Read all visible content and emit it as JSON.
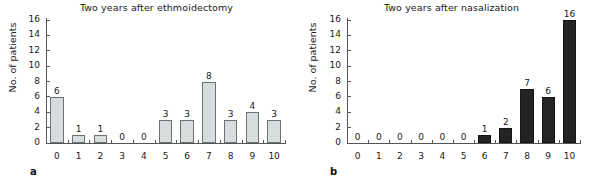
{
  "figure": {
    "panels": [
      {
        "letter": "a",
        "title": "Two years after ethmoidectomy",
        "ylabel": "No. of patients",
        "chart_data": {
          "type": "bar",
          "title": "Two years after ethmoidectomy",
          "xlabel": "",
          "ylabel": "No. of patients",
          "categories": [
            "0",
            "1",
            "2",
            "3",
            "4",
            "5",
            "6",
            "7",
            "8",
            "9",
            "10"
          ],
          "values": [
            6,
            1,
            1,
            0,
            0,
            3,
            3,
            8,
            3,
            4,
            3
          ],
          "data_labels": [
            "6",
            "1",
            "1",
            "0",
            "0",
            "3",
            "3",
            "8",
            "3",
            "4",
            "3"
          ],
          "ylim": [
            0,
            16
          ],
          "yticks": [
            0,
            2,
            4,
            6,
            8,
            10,
            12,
            14,
            16
          ],
          "ytick_labels": [
            "0",
            "2",
            "4",
            "6",
            "8",
            "10",
            "12",
            "14",
            "16"
          ],
          "grid": false,
          "legend": null,
          "bar_color": "#d7dcdd",
          "bar_edge_color": "#6d7375"
        }
      },
      {
        "letter": "b",
        "title": "Two years after nasalization",
        "ylabel": "No. of patients",
        "chart_data": {
          "type": "bar",
          "title": "Two years after nasalization",
          "xlabel": "",
          "ylabel": "No. of patients",
          "categories": [
            "0",
            "1",
            "2",
            "3",
            "4",
            "5",
            "6",
            "7",
            "8",
            "9",
            "10"
          ],
          "values": [
            0,
            0,
            0,
            0,
            0,
            0,
            1,
            2,
            7,
            6,
            16
          ],
          "data_labels": [
            "0",
            "0",
            "0",
            "0",
            "0",
            "0",
            "1",
            "2",
            "7",
            "6",
            "16"
          ],
          "ylim": [
            0,
            16
          ],
          "yticks": [
            0,
            2,
            4,
            6,
            8,
            10,
            12,
            14,
            16
          ],
          "ytick_labels": [
            "0",
            "2",
            "4",
            "6",
            "8",
            "10",
            "12",
            "14",
            "16"
          ],
          "grid": false,
          "legend": null,
          "bar_color": "#242424",
          "bar_edge_color": "#151515"
        }
      }
    ]
  },
  "chart_data": [
    {
      "type": "bar",
      "title": "Two years after ethmoidectomy",
      "xlabel": "",
      "ylabel": "No. of patients",
      "categories": [
        "0",
        "1",
        "2",
        "3",
        "4",
        "5",
        "6",
        "7",
        "8",
        "9",
        "10"
      ],
      "values": [
        6,
        1,
        1,
        0,
        0,
        3,
        3,
        8,
        3,
        4,
        3
      ],
      "ylim": [
        0,
        16
      ],
      "yticks": [
        0,
        2,
        4,
        6,
        8,
        10,
        12,
        14,
        16
      ],
      "grid": false,
      "legend": null
    },
    {
      "type": "bar",
      "title": "Two years after nasalization",
      "xlabel": "",
      "ylabel": "No. of patients",
      "categories": [
        "0",
        "1",
        "2",
        "3",
        "4",
        "5",
        "6",
        "7",
        "8",
        "9",
        "10"
      ],
      "values": [
        0,
        0,
        0,
        0,
        0,
        0,
        1,
        2,
        7,
        6,
        16
      ],
      "ylim": [
        0,
        16
      ],
      "yticks": [
        0,
        2,
        4,
        6,
        8,
        10,
        12,
        14,
        16
      ],
      "grid": false,
      "legend": null
    }
  ]
}
